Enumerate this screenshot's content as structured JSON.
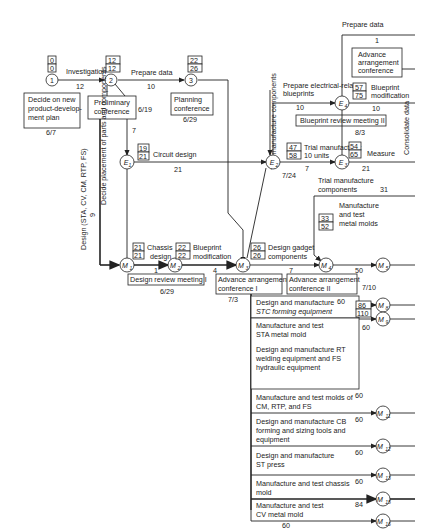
{
  "nodes": {
    "n1": "1",
    "n2": "2",
    "n3": "3",
    "E1": "E",
    "E1s": "1",
    "E2": "E",
    "E2s": "2",
    "E3": "E",
    "E3s": "3",
    "E4": "E",
    "E4s": "4",
    "M1": "M",
    "M1s": "1",
    "M2": "M",
    "M2s": "2",
    "M3": "M",
    "M3s": "3",
    "M4": "M",
    "M4s": "4",
    "M5": "M",
    "M5s": "5",
    "M8": "M",
    "M8s": "8",
    "M9": "M",
    "M9s": "9",
    "M11": "M",
    "M11s": "11",
    "M12": "M",
    "M12s": "12",
    "M13": "M",
    "M13s": "13",
    "M14": "M",
    "M14s": "14",
    "M15": "M",
    "M15s": "15",
    "M16": "M",
    "M16s": "16"
  },
  "times": {
    "n1": [
      "0",
      "0"
    ],
    "n2": [
      "12",
      "12"
    ],
    "n3": [
      "22",
      "26"
    ],
    "E1": [
      "19",
      "21"
    ],
    "E2": [
      "47",
      "58"
    ],
    "E3": [
      "54",
      "65"
    ],
    "E4": [
      "57",
      "75"
    ],
    "M1": [
      "21",
      "21"
    ],
    "M2": [
      "22",
      "22"
    ],
    "M3": [
      "26",
      "26"
    ],
    "M4": [
      "33",
      "52"
    ],
    "M9": [
      "86",
      "110"
    ]
  },
  "activities": {
    "investigation": "Investigation",
    "investigation_dur": "12",
    "prepare_data_1": "Prepare data",
    "prepare_data_1_dur": "10",
    "prepare_data_2": "Prepare data",
    "prepare_data_2_dur": "1",
    "circuit_design": "Circuit design",
    "circuit_design_dur": "21",
    "decide_placement": "Decide placement of parts and components",
    "decide_placement_dur": "7",
    "design_sta": "Design (STA, CV, CM, RTP, FS)",
    "design_sta_dur": "9",
    "chassis_design_1": "Chassis",
    "chassis_design_2": "design",
    "chassis_dur": "1",
    "blueprint_mod_1": "Blueprint",
    "blueprint_mod_2": "modification",
    "blueprint_mod_dur": "4",
    "design_gadget_1": "Design gadget",
    "design_gadget_2": "components",
    "design_gadget_dur": "7",
    "trial_components_v": "Trial manufacture components",
    "prep_elec_1": "Prepare electrical-related",
    "prep_elec_2": "blueprints",
    "prep_elec_dur": "10",
    "trial_mfg_1": "Trial manufacture:",
    "trial_mfg_2": "10 units",
    "trial_mfg_dur": "7",
    "bp_mod2_1": "Blueprint",
    "bp_mod2_2": "modification",
    "bp_mod2_dur": "10",
    "measure": "Measure",
    "measure_dur": "21",
    "consolidate": "Consolidate data",
    "trial_comp_1": "Trial manufacture",
    "trial_comp_2": "components",
    "trial_comp_dur": "31",
    "mt_molds_1": "Manufacture",
    "mt_molds_2": "and test",
    "mt_molds_3": "metal molds",
    "mt_molds_dur": "50",
    "stc_1": "Design and manufacture",
    "stc_2": "STC forming equipment",
    "stc_dur": "60",
    "sta_1": "Manufacture and test",
    "sta_2": "STA metal mold",
    "sta_dur": "60",
    "rt_1": "Design and manufacture RT",
    "rt_2": "welding equipment and FS",
    "rt_3": "hydraulic equipment",
    "cm_1": "Manufacture and test molds of",
    "cm_2": "CM, RTP, and FS",
    "cm_dur": "60",
    "cb_1": "Design and manufacture CB",
    "cb_2": "forming and sizing tools and",
    "cb_3": "equipment",
    "cb_dur": "60",
    "st_1": "Design and manufacture",
    "st_2": "ST press",
    "st_dur": "60",
    "chassis_mold_1": "Manufacture and test chassis",
    "chassis_mold_2": "mold",
    "chassis_mold_dur": "60",
    "cv_1": "Manufacture and test",
    "cv_2": "CV metal mold",
    "cv_dur": "84",
    "bottom_dur": "60"
  },
  "milestones": {
    "decide_plan_1": "Decide on new",
    "decide_plan_2": "product-develop-",
    "decide_plan_3": "ment plan",
    "decide_plan_date": "6/7",
    "prelim_1": "Preliminary",
    "prelim_2": "conference",
    "prelim_date": "6/19",
    "planning_1": "Planning",
    "planning_2": "conference",
    "planning_date": "6/29",
    "review1": "Design review meeting I",
    "review1_date": "6/29",
    "advance1_1": "Advance arrangement",
    "advance1_2": "conference I",
    "advance1_date": "7/3",
    "advance2_1": "Advance arrangement",
    "advance2_2": "conference II",
    "advance2_date": "7/10",
    "review2": "Blueprint review meeting II",
    "review2_date": "8/3",
    "e2_date": "7/24",
    "advance3_1": "Advance",
    "advance3_2": "arrangement",
    "advance3_3": "conference"
  }
}
